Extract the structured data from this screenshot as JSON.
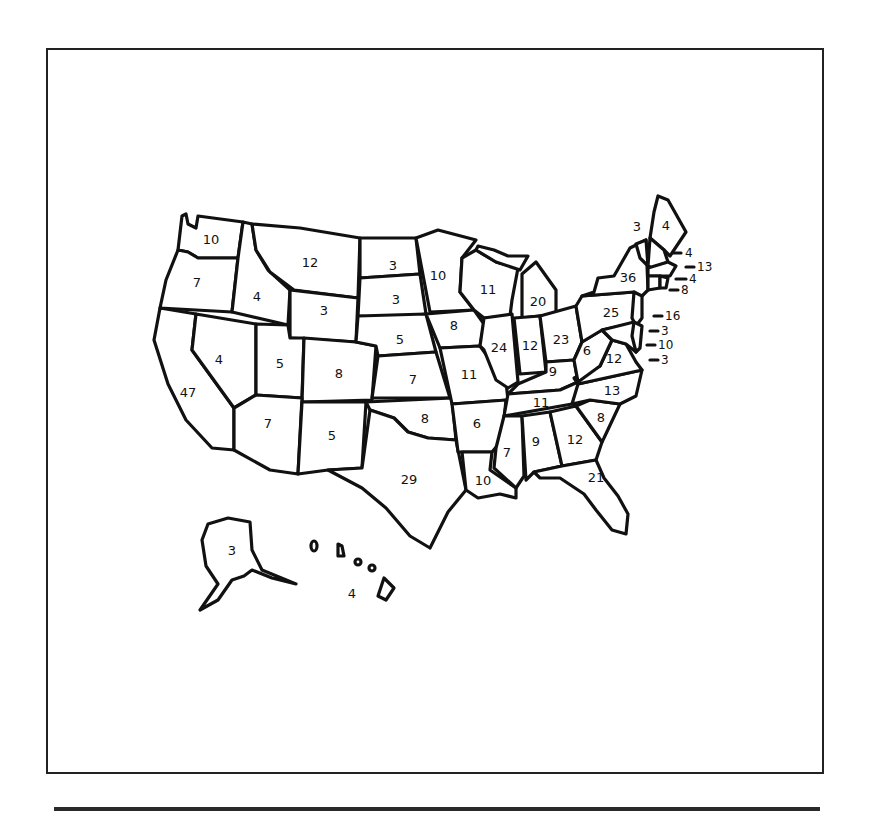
{
  "colors": {
    "ink": "#111111",
    "background": "#ffffff",
    "frame": "#222222"
  },
  "states": {
    "WA": "10",
    "OR": "7",
    "CA": "47",
    "ID": "4",
    "NV": "4",
    "MT": "12",
    "WY": "3",
    "UT": "5",
    "AZ": "7",
    "CO": "8",
    "NM": "5",
    "ND": "3",
    "SD": "3",
    "NE": "5",
    "KS": "7",
    "OK": "8",
    "TX": "29",
    "MN": "10",
    "IA": "8",
    "MO": "11",
    "AR": "6",
    "LA": "10",
    "WI": "11",
    "IL": "24",
    "MI": "20",
    "IN": "12",
    "OH": "23",
    "KY": "9",
    "TN": "11",
    "MS": "7",
    "AL": "9",
    "GA": "12",
    "FL": "21",
    "SC": "8",
    "NC": "13",
    "VA": "12",
    "WV": "6",
    "PA": "25",
    "NY": "36",
    "VT": "3",
    "ME": "4",
    "AK": "3",
    "HI": "4"
  },
  "callouts": {
    "NH": "4",
    "MA": "13",
    "RI": "4",
    "CT": "8",
    "NJ": "16",
    "DE": "3",
    "MD": "10",
    "DC": "3"
  }
}
